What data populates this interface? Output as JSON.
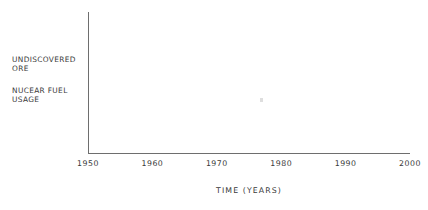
{
  "chart_data": {
    "type": "line",
    "title": "",
    "subtitle": "",
    "xlabel": "TIME  (YEARS)",
    "ylabel": "",
    "x_tick_labels": [
      "1950",
      "1960",
      "1970",
      "1980",
      "1990",
      "2000"
    ],
    "x_tick_values": [
      1950,
      1960,
      1970,
      1980,
      1990,
      2000
    ],
    "xlim": [
      1950,
      2000
    ],
    "y_tick_labels": [],
    "grid": false,
    "legend_position": "left-outside",
    "series": [
      {
        "name": "UNDISCOVERED\nORE",
        "values": []
      },
      {
        "name": "NUCEAR FUEL\nUSAGE",
        "values": []
      }
    ],
    "annotations": []
  },
  "figure": {
    "background_color": "#ffffff",
    "axis_color": "#6e6e6e",
    "text_color": "#3a3a3a",
    "category_labels": [
      "UNDISCOVERED\nORE",
      "NUCEAR FUEL\nUSAGE"
    ],
    "x_axis": {
      "title": "TIME  (YEARS)",
      "ticks": [
        "1950",
        "1960",
        "1970",
        "1980",
        "1990",
        "2000"
      ]
    }
  }
}
